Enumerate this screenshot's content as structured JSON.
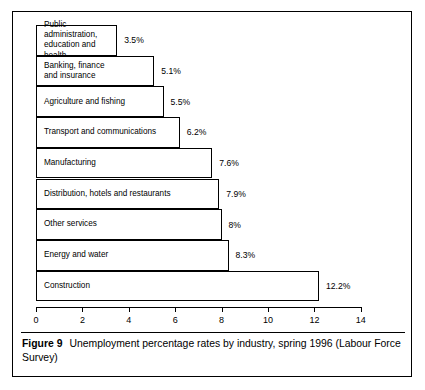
{
  "figure": {
    "caption_label": "Figure 9",
    "caption_text": "Unemployment percentage rates by industry, spring 1996 (Labour Force Survey)"
  },
  "chart_data": {
    "type": "bar",
    "orientation": "horizontal",
    "title": "Unemployment percentage rates by industry, spring 1996",
    "subtitle": "(Labour Force Survey)",
    "xlabel": "",
    "ylabel": "",
    "xlim": [
      0,
      14
    ],
    "grid": false,
    "legend": "none",
    "xticks": [
      0,
      2,
      4,
      6,
      8,
      10,
      12,
      14
    ],
    "xtick_labels": [
      "0",
      "2",
      "4",
      "6",
      "8",
      "10",
      "12",
      "14"
    ],
    "categories": [
      "Public administration, education and health",
      "Banking, finance and insurance",
      "Agriculture and fishing",
      "Transport and communications",
      "Manufacturing",
      "Distribution, hotels and restaurants",
      "Other services",
      "Energy and water",
      "Construction"
    ],
    "values": [
      3.5,
      5.1,
      5.5,
      6.2,
      7.6,
      7.9,
      8,
      8.3,
      12.2
    ],
    "value_labels": [
      "3.5%",
      "5.1%",
      "5.5%",
      "6.2%",
      "7.6%",
      "7.9%",
      "8%",
      "8.3%",
      "12.2%"
    ],
    "bars": [
      {
        "label": "Public administration,\neducation and health",
        "value": 3.5,
        "value_label": "3.5%"
      },
      {
        "label": "Banking, finance\nand insurance",
        "value": 5.1,
        "value_label": "5.1%"
      },
      {
        "label": "Agriculture and fishing",
        "value": 5.5,
        "value_label": "5.5%"
      },
      {
        "label": "Transport and communications",
        "value": 6.2,
        "value_label": "6.2%"
      },
      {
        "label": "Manufacturing",
        "value": 7.6,
        "value_label": "7.6%"
      },
      {
        "label": "Distribution, hotels and restaurants",
        "value": 7.9,
        "value_label": "7.9%"
      },
      {
        "label": "Other services",
        "value": 8,
        "value_label": "8%"
      },
      {
        "label": "Energy and water",
        "value": 8.3,
        "value_label": "8.3%"
      },
      {
        "label": "Construction",
        "value": 12.2,
        "value_label": "12.2%"
      }
    ],
    "colors": {
      "bar_fill": "#ffffff",
      "bar_stroke": "#000000",
      "axis": "#000000",
      "text": "#000000"
    }
  }
}
